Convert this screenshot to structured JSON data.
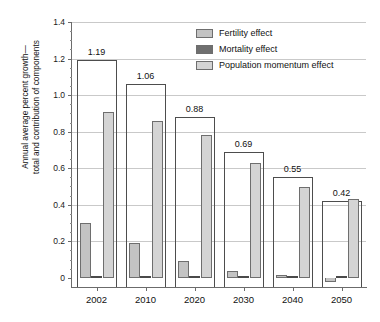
{
  "figure": {
    "title_cutoff": "",
    "y_axis_title_line1": "Annual average percent growth—",
    "y_axis_title_line2": "total and contribution of components"
  },
  "legend": {
    "position": "top-right",
    "items": [
      {
        "label": "Fertility effect",
        "color": "#c3c3c3",
        "key": "fertility"
      },
      {
        "label": "Mortality effect",
        "color": "#6f6f6f",
        "key": "mortality"
      },
      {
        "label": "Population momentum effect",
        "color": "#d4d4d4",
        "key": "momentum"
      }
    ]
  },
  "axes": {
    "y_ticks": [
      "0",
      "0.2",
      "0.4",
      "0.6",
      "0.8",
      "1.0",
      "1.2",
      "1.4"
    ],
    "y_tick_values": [
      0,
      0.2,
      0.4,
      0.6,
      0.8,
      1.0,
      1.2,
      1.4
    ],
    "y_min": -0.05,
    "y_max": 1.4,
    "x_ticks": [
      "2002",
      "2010",
      "2020",
      "2030",
      "2040",
      "2050"
    ],
    "grid": true
  },
  "chart_data": {
    "type": "bar",
    "title": "",
    "xlabel": "",
    "ylabel": "Annual average percent growth—total and contribution of components",
    "ylim": [
      -0.05,
      1.4
    ],
    "categories": [
      "2002",
      "2010",
      "2020",
      "2030",
      "2040",
      "2050"
    ],
    "total_labels": [
      "1.19",
      "1.06",
      "0.88",
      "0.69",
      "0.55",
      "0.42"
    ],
    "series": [
      {
        "name": "Total (outline)",
        "values": [
          1.19,
          1.06,
          0.88,
          0.69,
          0.55,
          0.42
        ]
      },
      {
        "name": "Fertility effect",
        "values": [
          0.3,
          0.19,
          0.09,
          0.04,
          0.015,
          -0.02
        ]
      },
      {
        "name": "Mortality effect",
        "values": [
          0.012,
          0.012,
          0.012,
          0.008,
          0.008,
          0.006
        ]
      },
      {
        "name": "Population momentum effect",
        "values": [
          0.91,
          0.86,
          0.78,
          0.63,
          0.5,
          0.43
        ]
      }
    ],
    "legend_position": "top-right",
    "grid": true
  }
}
